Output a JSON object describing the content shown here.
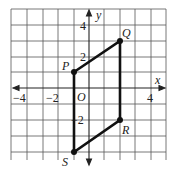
{
  "diagram": {
    "type": "coordinate-plane",
    "axes": {
      "x_label": "x",
      "y_label": "y"
    },
    "origin_label": "O",
    "x_tick_labels": [
      {
        "value": -4,
        "text": "−4"
      },
      {
        "value": -2,
        "text": "−2"
      },
      {
        "value": 4,
        "text": "4"
      }
    ],
    "y_tick_labels": [
      {
        "value": 4,
        "text": "4"
      },
      {
        "value": 2,
        "text": "2"
      },
      {
        "value": -2,
        "text": "−2"
      }
    ],
    "grid": {
      "x_range": [
        -5,
        5
      ],
      "y_range": [
        -4,
        5
      ]
    },
    "points": [
      {
        "name": "P",
        "x": -1,
        "y": 1
      },
      {
        "name": "Q",
        "x": 2,
        "y": 3
      },
      {
        "name": "R",
        "x": 2,
        "y": -2
      },
      {
        "name": "S",
        "x": -1,
        "y": -4
      }
    ],
    "polygon": [
      "P",
      "Q",
      "R",
      "S"
    ]
  }
}
